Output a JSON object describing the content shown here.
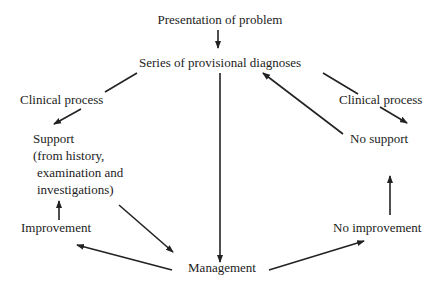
{
  "diagram": {
    "nodes": {
      "presentation": "Presentation of problem",
      "diagnoses": "Series of provisional diagnoses",
      "clinical_left": "Clinical process",
      "support_line1": "Support",
      "support_line2": "(from history,",
      "support_line3": "examination and",
      "support_line4": "investigations)",
      "improvement": "Improvement",
      "management": "Management",
      "clinical_right": "Clinical process",
      "no_support": "No support",
      "no_improvement": "No improvement"
    },
    "edges": [
      {
        "from": "Presentation of problem",
        "to": "Series of provisional diagnoses"
      },
      {
        "from": "Series of provisional diagnoses",
        "to": "Support",
        "via": "Clinical process"
      },
      {
        "from": "Series of provisional diagnoses",
        "to": "No support",
        "via": "Clinical process"
      },
      {
        "from": "Series of provisional diagnoses",
        "to": "Management"
      },
      {
        "from": "Support",
        "to": "Management"
      },
      {
        "from": "Management",
        "to": "Improvement"
      },
      {
        "from": "Improvement",
        "to": "Support"
      },
      {
        "from": "Management",
        "to": "No improvement"
      },
      {
        "from": "No improvement",
        "to": "No support"
      },
      {
        "from": "No support",
        "to": "Series of provisional diagnoses"
      }
    ],
    "colors": {
      "ink": "#222222",
      "background": "#ffffff"
    }
  }
}
